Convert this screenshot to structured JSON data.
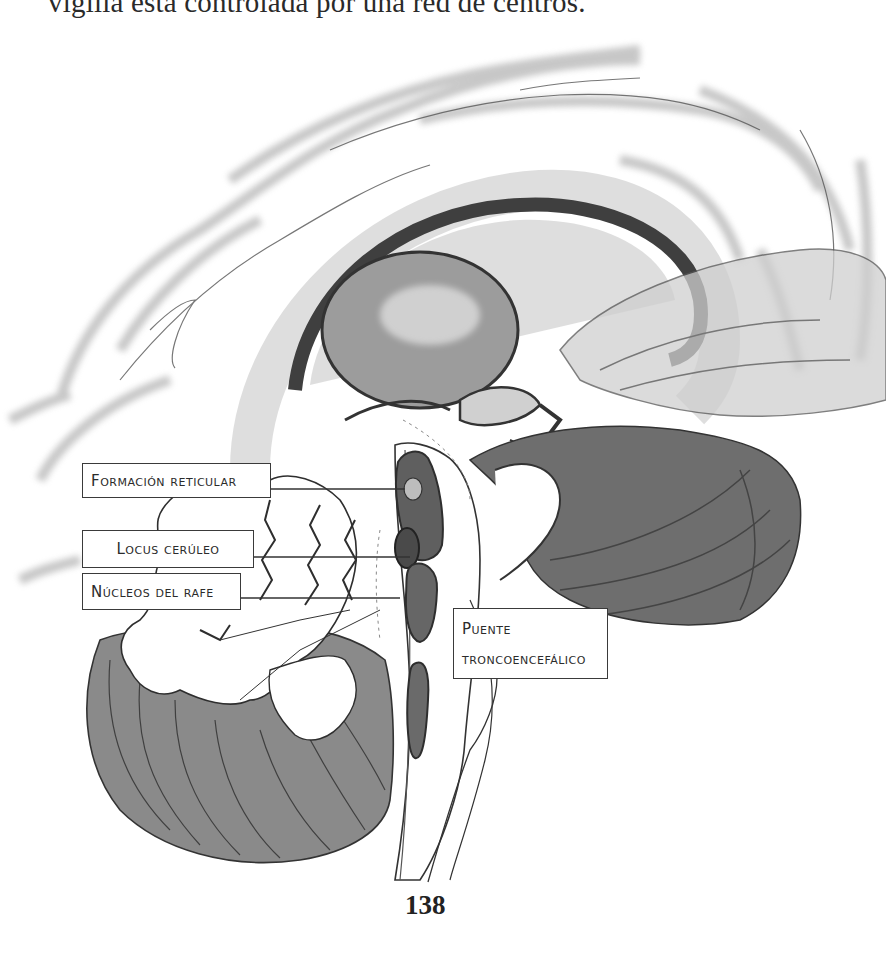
{
  "page": {
    "top_text": "vigilia está controlada por una red de centros.",
    "page_number": "138"
  },
  "figure": {
    "labels": {
      "formacion_reticular": "Formación reticular",
      "locus_ceruleo": "Locus cerúleo",
      "nucleos_rafe": "Núcleos del rafe",
      "puente_line1": "Puente",
      "puente_line2": "troncoencefálico"
    }
  }
}
